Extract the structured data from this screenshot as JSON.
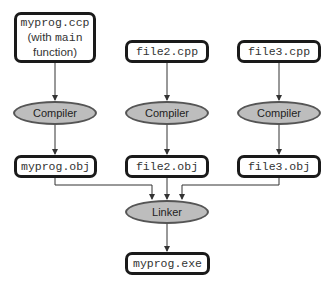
{
  "diagram": {
    "source_files": [
      {
        "id": "src1",
        "line1": "myprog.ccp",
        "line2_prefix": "(with ",
        "line2_code": "main",
        "line3": "function)"
      },
      {
        "id": "src2",
        "label": "file2.cpp"
      },
      {
        "id": "src3",
        "label": "file3.cpp"
      }
    ],
    "compilers": [
      {
        "label": "Compiler"
      },
      {
        "label": "Compiler"
      },
      {
        "label": "Compiler"
      }
    ],
    "object_files": [
      {
        "label": "myprog.obj"
      },
      {
        "label": "file2.obj"
      },
      {
        "label": "file3.obj"
      }
    ],
    "linker": {
      "label": "Linker"
    },
    "executable": {
      "label": "myprog.exe"
    },
    "colors": {
      "process_fill": "#bdbdbd",
      "box_border": "#1a1a1a",
      "arrow": "#333333"
    }
  }
}
